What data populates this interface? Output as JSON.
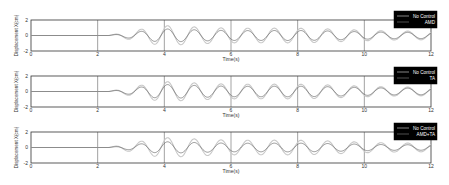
{
  "chart_data": [
    {
      "type": "line",
      "panel": 1,
      "title": "",
      "xlabel": "Time(s)",
      "ylabel": "Displacement X(cm)",
      "xlim": [
        0,
        12
      ],
      "ylim": [
        -2,
        2
      ],
      "xticks": [
        0,
        2,
        4,
        6,
        8,
        10,
        12
      ],
      "yticks": [
        -2,
        0,
        2
      ],
      "grid": "vertical gridlines at x ticks",
      "legend_position": "top-right",
      "series": [
        {
          "name": "No Control",
          "color": "#c8c8c8",
          "onset_s": 2.3,
          "period_s": 0.8,
          "peak_amplitude": 1.2,
          "final_amplitude": 0.55
        },
        {
          "name": "AMD",
          "color": "#555555",
          "onset_s": 2.3,
          "period_s": 0.8,
          "peak_amplitude": 0.8,
          "final_amplitude": 0.4
        }
      ]
    },
    {
      "type": "line",
      "panel": 2,
      "title": "",
      "xlabel": "Time(s)",
      "ylabel": "Displacement X(cm)",
      "xlim": [
        0,
        12
      ],
      "ylim": [
        -2,
        2
      ],
      "xticks": [
        0,
        2,
        4,
        6,
        8,
        10,
        12
      ],
      "yticks": [
        -2,
        0,
        2
      ],
      "grid": "vertical gridlines at x ticks",
      "legend_position": "top-right",
      "series": [
        {
          "name": "No Control",
          "color": "#c8c8c8",
          "onset_s": 2.3,
          "period_s": 0.8,
          "peak_amplitude": 1.2,
          "final_amplitude": 0.55
        },
        {
          "name": "TA",
          "color": "#555555",
          "onset_s": 2.3,
          "period_s": 0.8,
          "peak_amplitude": 0.85,
          "final_amplitude": 0.42
        }
      ]
    },
    {
      "type": "line",
      "panel": 3,
      "title": "",
      "xlabel": "Time(s)",
      "ylabel": "Displacement X(cm)",
      "xlim": [
        0,
        12
      ],
      "ylim": [
        -2,
        2
      ],
      "xticks": [
        0,
        2,
        4,
        6,
        8,
        10,
        12
      ],
      "yticks": [
        -2,
        0,
        2
      ],
      "grid": "vertical gridlines at x ticks",
      "legend_position": "top-right",
      "series": [
        {
          "name": "No Control",
          "color": "#c8c8c8",
          "onset_s": 2.3,
          "period_s": 0.8,
          "peak_amplitude": 1.2,
          "final_amplitude": 0.55
        },
        {
          "name": "AMD+TA",
          "color": "#555555",
          "onset_s": 2.3,
          "period_s": 0.8,
          "peak_amplitude": 0.7,
          "final_amplitude": 0.35
        }
      ]
    }
  ],
  "panels": [
    {
      "ylabel": "Displacement X(cm)",
      "xlabel": "Time(s)",
      "legend": [
        "No Control",
        "AMD"
      ]
    },
    {
      "ylabel": "Displacement X(cm)",
      "xlabel": "Time(s)",
      "legend": [
        "No Control",
        "TA"
      ]
    },
    {
      "ylabel": "Displacement X(cm)",
      "xlabel": "Time(s)",
      "legend": [
        "No Control",
        "AMD+TA"
      ]
    }
  ],
  "xticks": [
    "0",
    "2",
    "4",
    "6",
    "8",
    "10",
    "12"
  ],
  "yticks": [
    "2",
    "0",
    "-2"
  ],
  "colors": {
    "axis": "#333333",
    "grid": "#444444",
    "no_control": "#c8c8c8",
    "controlled": "#555555",
    "legend_bg": "#000000",
    "legend_text": "#ffffff"
  }
}
